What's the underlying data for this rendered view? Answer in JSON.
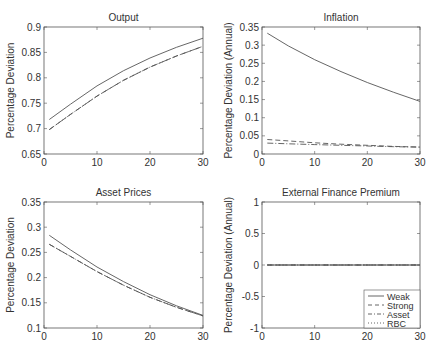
{
  "chart_data": [
    {
      "type": "line",
      "title": "Output",
      "xlabel": "",
      "ylabel": "Percentage Deviation",
      "xlim": [
        0,
        30
      ],
      "ylim": [
        0.65,
        0.9
      ],
      "xticks": [
        0,
        10,
        20,
        30
      ],
      "yticks": [
        0.65,
        0.7,
        0.75,
        0.8,
        0.85,
        0.9
      ],
      "ytick_labels": [
        "0.65",
        "0.7",
        "0.75",
        "0.8",
        "0.85",
        "0.9"
      ],
      "grid": false,
      "x": [
        1,
        5,
        10,
        15,
        20,
        25,
        30
      ],
      "series": [
        {
          "name": "Weak",
          "style": "solid",
          "values": [
            0.718,
            0.748,
            0.784,
            0.814,
            0.839,
            0.86,
            0.878
          ]
        },
        {
          "name": "Strong",
          "style": "dashed",
          "values": [
            0.698,
            0.728,
            0.764,
            0.795,
            0.821,
            0.843,
            0.862
          ]
        },
        {
          "name": "Asset",
          "style": "dashdot",
          "values": [
            0.698,
            0.728,
            0.764,
            0.795,
            0.821,
            0.843,
            0.862
          ]
        }
      ]
    },
    {
      "type": "line",
      "title": "Inflation",
      "xlabel": "",
      "ylabel": "Percentage Deviation (Annual)",
      "xlim": [
        0,
        30
      ],
      "ylim": [
        0,
        0.35
      ],
      "xticks": [
        0,
        10,
        20,
        30
      ],
      "yticks": [
        0,
        0.05,
        0.1,
        0.15,
        0.2,
        0.25,
        0.3,
        0.35
      ],
      "ytick_labels": [
        "0",
        "0.05",
        "0.1",
        "0.15",
        "0.2",
        "0.25",
        "0.3",
        "0.35"
      ],
      "grid": false,
      "x": [
        1,
        5,
        10,
        15,
        20,
        25,
        30
      ],
      "series": [
        {
          "name": "Weak",
          "style": "solid",
          "values": [
            0.333,
            0.298,
            0.26,
            0.227,
            0.197,
            0.17,
            0.145
          ]
        },
        {
          "name": "Strong",
          "style": "dashed",
          "values": [
            0.04,
            0.036,
            0.031,
            0.027,
            0.024,
            0.021,
            0.019
          ]
        },
        {
          "name": "Asset",
          "style": "dashdot",
          "values": [
            0.03,
            0.028,
            0.026,
            0.024,
            0.022,
            0.02,
            0.019
          ]
        }
      ]
    },
    {
      "type": "line",
      "title": "Asset Prices",
      "xlabel": "",
      "ylabel": "Percentage Deviation",
      "xlim": [
        0,
        30
      ],
      "ylim": [
        0.1,
        0.35
      ],
      "xticks": [
        0,
        10,
        20,
        30
      ],
      "yticks": [
        0.1,
        0.15,
        0.2,
        0.25,
        0.3,
        0.35
      ],
      "ytick_labels": [
        "0.1",
        "0.15",
        "0.2",
        "0.25",
        "0.3",
        "0.35"
      ],
      "grid": false,
      "x": [
        1,
        5,
        10,
        15,
        20,
        25,
        30
      ],
      "series": [
        {
          "name": "Weak",
          "style": "solid",
          "values": [
            0.284,
            0.255,
            0.221,
            0.192,
            0.166,
            0.144,
            0.125
          ]
        },
        {
          "name": "Strong",
          "style": "dashed",
          "values": [
            0.266,
            0.242,
            0.212,
            0.185,
            0.161,
            0.141,
            0.124
          ]
        },
        {
          "name": "Asset",
          "style": "dashdot",
          "values": [
            0.266,
            0.242,
            0.212,
            0.185,
            0.161,
            0.141,
            0.124
          ]
        }
      ]
    },
    {
      "type": "line",
      "title": "External Finance Premium",
      "xlabel": "",
      "ylabel": "Percentage Deviation (Annual)",
      "xlim": [
        0,
        30
      ],
      "ylim": [
        -1,
        1
      ],
      "xticks": [
        0,
        10,
        20,
        30
      ],
      "yticks": [
        -1,
        -0.5,
        0,
        0.5,
        1
      ],
      "ytick_labels": [
        "-1",
        "-0.5",
        "0",
        "0.5",
        "1"
      ],
      "grid": false,
      "x": [
        1,
        5,
        10,
        15,
        20,
        25,
        30
      ],
      "series": [
        {
          "name": "Weak",
          "style": "solid",
          "values": [
            0,
            0,
            0,
            0,
            0,
            0,
            0
          ]
        },
        {
          "name": "Strong",
          "style": "dashed",
          "values": [
            0,
            0,
            0,
            0,
            0,
            0,
            0
          ]
        },
        {
          "name": "Asset",
          "style": "dashdot",
          "values": [
            0,
            0,
            0,
            0,
            0,
            0,
            0
          ]
        },
        {
          "name": "RBC",
          "style": "dotted",
          "values": [
            0,
            0,
            0,
            0,
            0,
            0,
            0
          ]
        }
      ],
      "legend": {
        "position": "lower right",
        "entries": [
          {
            "label": "Weak",
            "style": "solid"
          },
          {
            "label": "Strong",
            "style": "dashed"
          },
          {
            "label": "Asset",
            "style": "dashdot"
          },
          {
            "label": "RBC",
            "style": "dotted"
          }
        ]
      }
    }
  ],
  "colors": {
    "axis": "#555555",
    "line": "#555555",
    "text": "#333333"
  }
}
